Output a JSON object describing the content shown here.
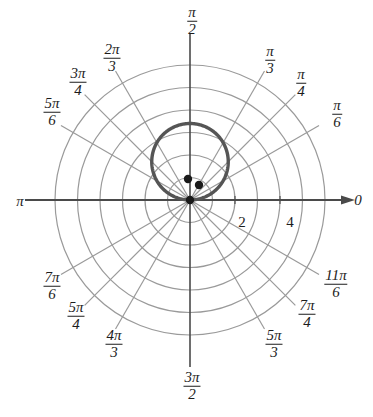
{
  "figure": {
    "kind": "polar-plot",
    "background": "#ffffff",
    "center_px": [
      190,
      200
    ],
    "unit_px": 22.5,
    "grid_color": "#9a9a9a",
    "axis_color": "#4a4a4a",
    "curve_color": "#555555",
    "point_color": "#1a1a1a"
  },
  "chart_data": {
    "type": "line",
    "coordinate_system": "polar",
    "title": "",
    "xlabel": "",
    "ylabel": "",
    "rlim": [
      0,
      6
    ],
    "grid": true,
    "legend": null,
    "r_ticks": [
      1,
      2,
      3,
      4,
      5,
      6
    ],
    "r_tick_labels": [
      "",
      "2",
      "",
      "4",
      "",
      ""
    ],
    "theta_ticks_rad": [
      0,
      0.5236,
      0.7854,
      1.0472,
      1.5708,
      2.0944,
      2.3562,
      2.618,
      3.1416,
      3.6652,
      3.927,
      4.1888,
      4.7124,
      5.236,
      5.4978,
      5.7596
    ],
    "theta_tick_labels": [
      "0",
      "π/6",
      "π/4",
      "π/3",
      "π/2",
      "2π/3",
      "3π/4",
      "5π/6",
      "π",
      "7π/6",
      "5π/4",
      "4π/3",
      "3π/2",
      "5π/3",
      "7π/4",
      "11π/6"
    ],
    "series": [
      {
        "name": "curve",
        "equation": "r = 3.4 sin(theta)",
        "closed": true,
        "theta_deg": [
          0,
          10,
          20,
          30,
          40,
          50,
          60,
          70,
          80,
          90,
          100,
          110,
          120,
          130,
          140,
          150,
          160,
          170,
          180
        ],
        "r": [
          0,
          0.59,
          1.16,
          1.7,
          2.19,
          2.6,
          2.94,
          3.19,
          3.35,
          3.4,
          3.35,
          3.19,
          2.94,
          2.6,
          2.19,
          1.7,
          1.16,
          0.59,
          0
        ]
      }
    ],
    "points": [
      {
        "label": "",
        "x_px": 190,
        "y_px": 200,
        "r": 0,
        "theta_deg": 0
      },
      {
        "label": "",
        "x_px": 188,
        "y_px": 179,
        "r": 0.93,
        "theta_deg": 95
      },
      {
        "label": "",
        "x_px": 199,
        "y_px": 185,
        "r": 0.78,
        "theta_deg": 59
      }
    ]
  },
  "labels": {
    "t0": "0",
    "t_pi_6_num": "π",
    "t_pi_6_den": "6",
    "t_pi_4_num": "π",
    "t_pi_4_den": "4",
    "t_pi_3_num": "π",
    "t_pi_3_den": "3",
    "t_pi_2_num": "π",
    "t_pi_2_den": "2",
    "t_2pi_3_num": "2π",
    "t_2pi_3_den": "3",
    "t_3pi_4_num": "3π",
    "t_3pi_4_den": "4",
    "t_5pi_6_num": "5π",
    "t_5pi_6_den": "6",
    "t_pi": "π",
    "t_7pi_6_num": "7π",
    "t_7pi_6_den": "6",
    "t_5pi_4_num": "5π",
    "t_5pi_4_den": "4",
    "t_4pi_3_num": "4π",
    "t_4pi_3_den": "3",
    "t_3pi_2_num": "3π",
    "t_3pi_2_den": "2",
    "t_5pi_3_num": "5π",
    "t_5pi_3_den": "3",
    "t_7pi_4_num": "7π",
    "t_7pi_4_den": "4",
    "t_11pi_6_num": "11π",
    "t_11pi_6_den": "6",
    "r_tick_2": "2",
    "r_tick_4": "4"
  }
}
